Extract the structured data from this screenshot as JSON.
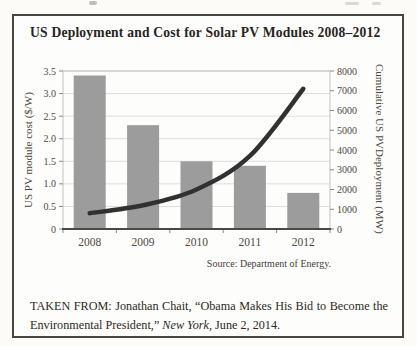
{
  "figure": {
    "title": "US Deployment and Cost for Solar PV Modules 2008–2012",
    "source": "Source: Department of Energy.",
    "caption": {
      "label_part": "TAKEN FROM: Jonathan Chait, “Obama Makes His Bid to Become the Environmental President,” ",
      "work_italic": "New York",
      "tail": ", June 2, 2014."
    }
  },
  "chart_data": {
    "type": "combo",
    "categories": [
      "2008",
      "2009",
      "2010",
      "2011",
      "2012"
    ],
    "series": [
      {
        "name": "US PV module cost ($/W)",
        "type": "bar",
        "axis": "left",
        "values": [
          3.4,
          2.3,
          1.5,
          1.4,
          0.8
        ]
      },
      {
        "name": "Cumulative US PV Deployment (MW)",
        "type": "line",
        "axis": "right",
        "values": [
          800,
          1200,
          2000,
          3700,
          7100
        ]
      }
    ],
    "left_axis": {
      "title": "US PV module cost ($/W)",
      "min": 0,
      "max": 3.5,
      "step": 0.5,
      "tick_labels": [
        "0",
        "0.5",
        "1.0",
        "1.5",
        "2.0",
        "2.5",
        "3.0",
        "3.5"
      ]
    },
    "right_axis": {
      "title_line1": "Cumulative US PV",
      "title_line2": "Deployment (MW)",
      "min": 0,
      "max": 8000,
      "step": 1000,
      "tick_labels": [
        "0",
        "1000",
        "2000",
        "3000",
        "4000",
        "5000",
        "6000",
        "7000",
        "8000"
      ]
    },
    "grid": true,
    "legend": "none",
    "bar_color": "#9c9c9c",
    "line_color": "#313131",
    "grid_color": "#dcdcda",
    "plot_border_color": "#c4c3bf",
    "axis_color": "#4a4944",
    "tick_color": "#8a8984"
  }
}
